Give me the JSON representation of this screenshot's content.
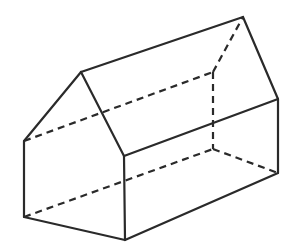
{
  "figure": {
    "background": "#ffffff",
    "stroke_color": "#2a2a2a",
    "stroke_width": 2.2,
    "dash_pattern": "7 5",
    "vertices": {
      "front_top_left": [
        24,
        141
      ],
      "front_apex": [
        81,
        72
      ],
      "front_top_right": [
        124,
        156
      ],
      "front_bottom_right": [
        125,
        240
      ],
      "front_bottom_left": [
        24,
        217
      ],
      "back_top_left": [
        213,
        72
      ],
      "back_apex": [
        243,
        17
      ],
      "back_top_right": [
        278,
        99
      ],
      "back_bottom_right": [
        278,
        173
      ],
      "back_bottom_left": [
        213,
        149
      ]
    },
    "solid_edges": [
      [
        "front_bottom_left",
        "front_top_left"
      ],
      [
        "front_top_left",
        "front_apex"
      ],
      [
        "front_apex",
        "front_top_right"
      ],
      [
        "front_top_right",
        "front_bottom_right"
      ],
      [
        "front_bottom_right",
        "front_bottom_left"
      ],
      [
        "front_apex",
        "back_apex"
      ],
      [
        "back_apex",
        "back_top_right"
      ],
      [
        "front_top_right",
        "back_top_right"
      ],
      [
        "back_top_right",
        "back_bottom_right"
      ],
      [
        "front_bottom_right",
        "back_bottom_right"
      ]
    ],
    "hidden_edges": [
      [
        "front_top_left",
        "back_top_left"
      ],
      [
        "front_bottom_left",
        "back_bottom_left"
      ],
      [
        "back_top_left",
        "back_apex"
      ],
      [
        "back_top_left",
        "back_bottom_left"
      ],
      [
        "back_bottom_left",
        "back_bottom_right"
      ]
    ]
  }
}
